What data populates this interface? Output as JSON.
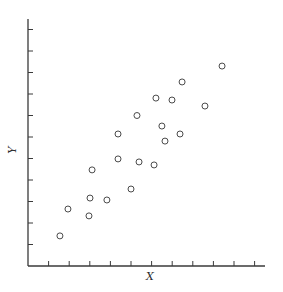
{
  "chart_data": {
    "type": "scatter",
    "title": "",
    "xlabel": "X",
    "ylabel": "Y",
    "x_ticks": 11,
    "y_ticks": 11,
    "tick_labels_shown": false,
    "grid": false,
    "legend": null,
    "xlim": [
      0,
      11
    ],
    "ylim": [
      0,
      11.5
    ],
    "marker": "open-circle",
    "points": [
      {
        "x": 1.55,
        "y": 1.4
      },
      {
        "x": 1.94,
        "y": 2.65
      },
      {
        "x": 2.96,
        "y": 2.33
      },
      {
        "x": 3.01,
        "y": 3.16
      },
      {
        "x": 3.11,
        "y": 4.47
      },
      {
        "x": 3.83,
        "y": 3.07
      },
      {
        "x": 4.37,
        "y": 6.14
      },
      {
        "x": 4.37,
        "y": 4.98
      },
      {
        "x": 5.0,
        "y": 3.58
      },
      {
        "x": 5.29,
        "y": 7.0
      },
      {
        "x": 5.39,
        "y": 4.84
      },
      {
        "x": 6.12,
        "y": 4.7
      },
      {
        "x": 6.21,
        "y": 7.81
      },
      {
        "x": 6.5,
        "y": 6.51
      },
      {
        "x": 6.65,
        "y": 5.81
      },
      {
        "x": 6.99,
        "y": 7.72
      },
      {
        "x": 7.38,
        "y": 6.14
      },
      {
        "x": 7.48,
        "y": 8.56
      },
      {
        "x": 8.59,
        "y": 7.44
      },
      {
        "x": 9.42,
        "y": 9.3
      }
    ]
  },
  "labels": {
    "x": "X",
    "y": "Y"
  }
}
